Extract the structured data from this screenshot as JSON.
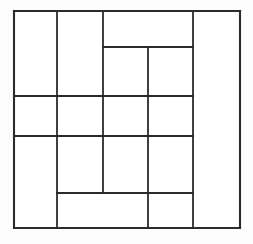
{
  "figure": {
    "kind": "partitioned-rectangle-diagram",
    "title": "",
    "caption": "",
    "background_color": "#fdfdfd",
    "line_color": "#2b2b2b",
    "fill_color": "#ffffff",
    "canvas": {
      "width": 253,
      "height": 244
    },
    "bounds": {
      "x0": 14,
      "y0": 11,
      "x1": 240,
      "y1": 228
    },
    "grid": {
      "x_positions": [
        14,
        57,
        103,
        148,
        193,
        240
      ],
      "y_positions": [
        11,
        47,
        96,
        136,
        193,
        228
      ]
    },
    "segments": {
      "outer": [
        {
          "name": "outer-top",
          "x1": 14,
          "y1": 11,
          "x2": 240,
          "y2": 11
        },
        {
          "name": "outer-right",
          "x1": 240,
          "y1": 11,
          "x2": 240,
          "y2": 228
        },
        {
          "name": "outer-bottom",
          "x1": 14,
          "y1": 228,
          "x2": 240,
          "y2": 228
        },
        {
          "name": "outer-left",
          "x1": 14,
          "y1": 11,
          "x2": 14,
          "y2": 228
        }
      ],
      "vertical": [
        {
          "name": "v-col-1",
          "x1": 57,
          "y1": 11,
          "x2": 57,
          "y2": 228
        },
        {
          "name": "v-col-2",
          "x1": 103,
          "y1": 11,
          "x2": 103,
          "y2": 193
        },
        {
          "name": "v-col-3",
          "x1": 148,
          "y1": 47,
          "x2": 148,
          "y2": 228
        },
        {
          "name": "v-col-4",
          "x1": 193,
          "y1": 11,
          "x2": 193,
          "y2": 228
        }
      ],
      "horizontal": [
        {
          "name": "h-row-1",
          "x1": 103,
          "y1": 47,
          "x2": 193,
          "y2": 47
        },
        {
          "name": "h-row-2",
          "x1": 14,
          "y1": 96,
          "x2": 193,
          "y2": 96
        },
        {
          "name": "h-row-3",
          "x1": 14,
          "y1": 136,
          "x2": 193,
          "y2": 136
        },
        {
          "name": "h-row-4",
          "x1": 57,
          "y1": 193,
          "x2": 193,
          "y2": 193
        }
      ]
    },
    "regions": [
      {
        "name": "region-left-tall",
        "x": 14,
        "y": 11,
        "w": 43,
        "h": 85
      },
      {
        "name": "region-left-mid-upper",
        "x": 14,
        "y": 96,
        "w": 43,
        "h": 40
      },
      {
        "name": "region-left-bottom-tall",
        "x": 14,
        "y": 136,
        "w": 43,
        "h": 92
      },
      {
        "name": "region-col2-tall",
        "x": 57,
        "y": 11,
        "w": 46,
        "h": 85
      },
      {
        "name": "region-col2-mid",
        "x": 57,
        "y": 96,
        "w": 46,
        "h": 40
      },
      {
        "name": "region-col2-lower",
        "x": 57,
        "y": 136,
        "w": 46,
        "h": 57
      },
      {
        "name": "region-top-wide",
        "x": 103,
        "y": 11,
        "w": 90,
        "h": 36
      },
      {
        "name": "region-col3-upper",
        "x": 103,
        "y": 47,
        "w": 45,
        "h": 49
      },
      {
        "name": "region-col3-mid",
        "x": 103,
        "y": 96,
        "w": 45,
        "h": 40
      },
      {
        "name": "region-col3-lower",
        "x": 103,
        "y": 136,
        "w": 45,
        "h": 57
      },
      {
        "name": "region-col4-upper",
        "x": 148,
        "y": 47,
        "w": 45,
        "h": 49
      },
      {
        "name": "region-col4-mid",
        "x": 148,
        "y": 96,
        "w": 45,
        "h": 40
      },
      {
        "name": "region-col4-lower",
        "x": 148,
        "y": 136,
        "w": 45,
        "h": 57
      },
      {
        "name": "region-bottom-wide",
        "x": 57,
        "y": 193,
        "w": 91,
        "h": 35
      },
      {
        "name": "region-bottom-right",
        "x": 148,
        "y": 193,
        "w": 45,
        "h": 35
      },
      {
        "name": "region-right-full",
        "x": 193,
        "y": 11,
        "w": 47,
        "h": 217
      }
    ]
  }
}
